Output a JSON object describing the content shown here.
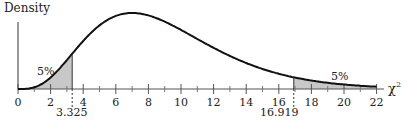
{
  "chart_data": {
    "type": "area",
    "title": "",
    "ylabel": "Density",
    "xlabel": "χ²",
    "distribution": "chi-square",
    "degrees_of_freedom": 9,
    "xlim": [
      0,
      22
    ],
    "x_ticks": [
      0,
      2,
      4,
      6,
      8,
      10,
      12,
      14,
      16,
      18,
      20,
      22
    ],
    "minor_ticks": [
      1,
      3,
      5,
      7,
      9,
      11,
      13,
      15,
      17,
      19,
      21
    ],
    "critical_values": [
      3.325,
      16.919
    ],
    "critical_labels": [
      "3.325",
      "16.919"
    ],
    "shaded_regions": [
      {
        "from": 0,
        "to": 3.325,
        "label": "5%",
        "tail": "lower"
      },
      {
        "from": 16.919,
        "to": 22,
        "label": "5%",
        "tail": "upper"
      }
    ],
    "grid": false,
    "legend": null
  },
  "labels": {
    "ylabel": "Density",
    "xlabel": "χ",
    "xlabel_sup": "2",
    "lower_tail": "5%",
    "upper_tail": "5%",
    "crit_low": "3.325",
    "crit_high": "16.919"
  },
  "colors": {
    "curve": "#111111",
    "axis": "#555555",
    "shade": "#c8c8c8"
  }
}
